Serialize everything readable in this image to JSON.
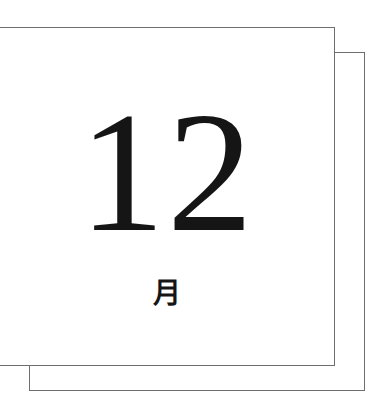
{
  "calendar": {
    "number": "12",
    "month_label": "月"
  },
  "colors": {
    "border": "#6e6e6e",
    "text": "#151515",
    "background": "#ffffff"
  }
}
